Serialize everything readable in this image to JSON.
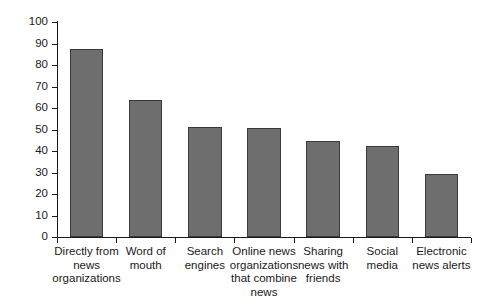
{
  "chart_data": {
    "type": "bar",
    "title": "",
    "subtitle": "",
    "xlabel": "",
    "ylabel": "% Used method last week",
    "ylim": [
      0,
      100
    ],
    "grid": false,
    "legend": false,
    "legend_position": "none",
    "bar_color": "#6e6e6e",
    "bar_edge_color": "#3a3a3a",
    "axis_color": "#1a1a1a",
    "background_color": "#ffffff",
    "ytick_labels": [
      "0",
      "10",
      "20",
      "30",
      "40",
      "50",
      "60",
      "70",
      "80",
      "90",
      "100"
    ],
    "ytick_values": [
      0,
      10,
      20,
      30,
      40,
      50,
      60,
      70,
      80,
      90,
      100
    ],
    "categories": [
      "Directly from\nnews\norganizations",
      "Word of\nmouth",
      "Search\nengines",
      "Online news\norganizations\nthat combine\nnews",
      "Sharing\nnews with\nfriends",
      "Social\nmedia",
      "Electronic\nnews alerts"
    ],
    "values": [
      87.5,
      63.5,
      51,
      50.5,
      44.5,
      42.5,
      29.5
    ]
  }
}
